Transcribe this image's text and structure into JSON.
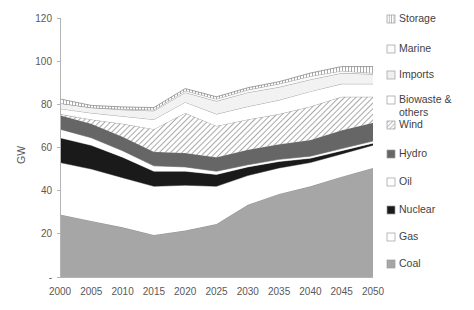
{
  "chart_data": {
    "type": "area",
    "title": "",
    "xlabel": "",
    "ylabel": "GW",
    "ylim": [
      0,
      120
    ],
    "ytick_labels": [
      "-",
      "20",
      "40",
      "60",
      "80",
      "100",
      "120"
    ],
    "yticks": [
      0,
      20,
      40,
      60,
      80,
      100,
      120
    ],
    "grid": false,
    "legend_position": "right",
    "stacked": true,
    "categories": [
      2000,
      2005,
      2010,
      2015,
      2020,
      2025,
      2030,
      2035,
      2040,
      2045,
      2050
    ],
    "x_tick_labels": [
      "2000",
      "2005",
      "2010",
      "2015",
      "2020",
      "2025",
      "2030",
      "2035",
      "2040",
      "2045",
      "2050"
    ],
    "series": [
      {
        "name": "Coal",
        "fill": "#a6a6a6",
        "pattern": "solid",
        "values": [
          29.0,
          26.0,
          23.0,
          19.5,
          21.5,
          24.5,
          33.5,
          38.5,
          42.0,
          46.5,
          50.5
        ]
      },
      {
        "name": "Gas",
        "fill": "#ffffff",
        "pattern": "solid",
        "values": [
          24.0,
          24.0,
          23.0,
          22.5,
          21.0,
          17.5,
          13.5,
          12.0,
          11.0,
          10.5,
          10.5
        ]
      },
      {
        "name": "Nuclear",
        "fill": "#1a1a1a",
        "pattern": "solid",
        "values": [
          11.5,
          11.0,
          9.5,
          7.0,
          6.5,
          5.5,
          4.0,
          3.0,
          2.0,
          1.5,
          1.0
        ]
      },
      {
        "name": "Oil",
        "fill": "#ffffff",
        "pattern": "solid",
        "values": [
          4.0,
          3.5,
          3.0,
          2.5,
          2.0,
          1.5,
          1.0,
          1.0,
          1.0,
          1.0,
          1.0
        ]
      },
      {
        "name": "Hydro",
        "fill": "#666666",
        "pattern": "solid",
        "values": [
          6.5,
          6.5,
          6.5,
          6.5,
          6.5,
          6.5,
          7.0,
          7.0,
          7.5,
          8.5,
          8.5
        ]
      },
      {
        "name": "Wind",
        "fill": "#e8e8e8",
        "pattern": "diagonal",
        "values": [
          0.5,
          2.0,
          6.0,
          10.5,
          18.5,
          14.5,
          14.0,
          14.0,
          15.5,
          15.5,
          12.0
        ]
      },
      {
        "name": "Biowaste & others",
        "fill": "#ffffff",
        "pattern": "solid",
        "values": [
          2.5,
          3.0,
          3.5,
          4.5,
          5.0,
          5.5,
          6.0,
          6.5,
          7.0,
          6.0,
          6.0
        ]
      },
      {
        "name": "Imports",
        "fill": "#f2f2f2",
        "pattern": "solid",
        "values": [
          2.5,
          2.5,
          3.0,
          4.0,
          4.5,
          6.0,
          6.5,
          6.0,
          5.5,
          5.0,
          4.5
        ]
      },
      {
        "name": "Marine",
        "fill": "#fafafa",
        "pattern": "solid",
        "values": [
          0.0,
          0.0,
          0.3,
          0.5,
          0.8,
          1.0,
          1.2,
          1.5,
          1.5,
          1.0,
          0.5
        ]
      },
      {
        "name": "Storage",
        "fill": "#d9d9d9",
        "pattern": "vertical",
        "values": [
          2.0,
          1.0,
          1.0,
          1.0,
          1.0,
          1.0,
          1.0,
          1.0,
          1.5,
          2.0,
          3.0
        ]
      }
    ]
  },
  "legend": {
    "items": [
      {
        "label": "Storage",
        "swatch": "vertical",
        "fill": "#d9d9d9"
      },
      {
        "label": "Marine",
        "swatch": "solid",
        "fill": "#fbfbfb"
      },
      {
        "label": "Imports",
        "swatch": "solid",
        "fill": "#f0f0f0"
      },
      {
        "label": "Biowaste &",
        "label2": "others",
        "swatch": "solid",
        "fill": "#ffffff"
      },
      {
        "label": "Wind",
        "swatch": "diagonal",
        "fill": "#ececec"
      },
      {
        "label": "Hydro",
        "swatch": "solid",
        "fill": "#666666"
      },
      {
        "label": "Oil",
        "swatch": "solid",
        "fill": "#ffffff"
      },
      {
        "label": "Nuclear",
        "swatch": "solid",
        "fill": "#1a1a1a"
      },
      {
        "label": "Gas",
        "swatch": "solid",
        "fill": "#ffffff"
      },
      {
        "label": "Coal",
        "swatch": "solid",
        "fill": "#a6a6a6"
      }
    ]
  }
}
